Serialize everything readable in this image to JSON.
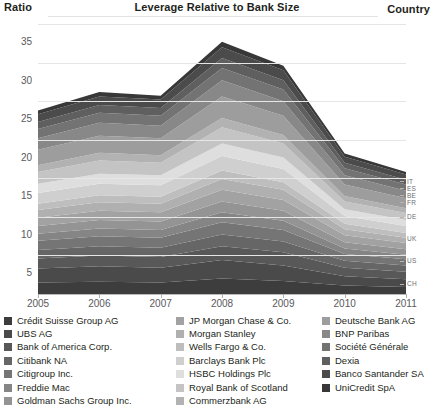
{
  "header": {
    "y_axis_title": "Ratio",
    "title": "Leverage Relative to Bank Size",
    "right_axis_title": "Country"
  },
  "chart_data": {
    "type": "area",
    "title": "Leverage Relative to Bank Size",
    "xlabel": "",
    "ylabel": "Ratio",
    "ylim": [
      0,
      35
    ],
    "yticks": [
      0,
      5,
      10,
      15,
      20,
      25,
      30,
      35
    ],
    "ytick_labels": [
      "",
      "5",
      "10",
      "15",
      "20",
      "25",
      "30",
      "35"
    ],
    "x": [
      2005,
      2006,
      2007,
      2008,
      2009,
      2010,
      2011
    ],
    "xtick_labels": [
      "2005",
      "2006",
      "2007",
      "2008",
      "2009",
      "2010",
      "2011"
    ],
    "grid": true,
    "stacked": true,
    "legend_position": "bottom",
    "country_axis": {
      "label": "Country",
      "ticks": [
        {
          "code": "IT",
          "value": 14.6
        },
        {
          "code": "ES",
          "value": 13.7
        },
        {
          "code": "BE",
          "value": 12.8
        },
        {
          "code": "FR",
          "value": 11.9
        },
        {
          "code": "DE",
          "value": 10.0
        },
        {
          "code": "UK",
          "value": 7.2
        },
        {
          "code": "US",
          "value": 4.3
        },
        {
          "code": "CH",
          "value": 1.3
        }
      ]
    },
    "totals": [
      22.8,
      24.9,
      24.6,
      31.0,
      28.2,
      17.2,
      15.0
    ],
    "series": [
      {
        "name": "Crédit Suisse Group AG",
        "color": "#3d3d3d",
        "values": [
          1.5,
          1.6,
          1.5,
          2.0,
          1.7,
          1.1,
          0.9
        ]
      },
      {
        "name": "UBS AG",
        "color": "#4a4a4a",
        "values": [
          1.8,
          2.0,
          1.9,
          2.4,
          2.0,
          1.2,
          1.0
        ]
      },
      {
        "name": "Bank of America Corp.",
        "color": "#585858",
        "values": [
          1.3,
          1.4,
          1.4,
          1.8,
          1.7,
          1.1,
          1.0
        ]
      },
      {
        "name": "Citibank NA",
        "color": "#666666",
        "values": [
          1.1,
          1.2,
          1.2,
          1.5,
          1.4,
          0.9,
          0.8
        ]
      },
      {
        "name": "Citigroup Inc.",
        "color": "#757575",
        "values": [
          1.2,
          1.3,
          1.3,
          1.6,
          1.5,
          0.9,
          0.8
        ]
      },
      {
        "name": "Freddie Mac",
        "color": "#858585",
        "values": [
          0.9,
          1.0,
          1.0,
          1.3,
          1.2,
          0.7,
          0.6
        ]
      },
      {
        "name": "Goldman Sachs Group Inc.",
        "color": "#949494",
        "values": [
          1.0,
          1.1,
          1.1,
          1.4,
          1.3,
          0.8,
          0.7
        ]
      },
      {
        "name": "JP Morgan Chase & Co.",
        "color": "#a2a2a2",
        "values": [
          1.1,
          1.2,
          1.2,
          1.5,
          1.4,
          0.9,
          0.8
        ]
      },
      {
        "name": "Morgan Stanley",
        "color": "#b0b0b0",
        "values": [
          1.0,
          1.1,
          1.1,
          1.4,
          1.3,
          0.8,
          0.7
        ]
      },
      {
        "name": "Wells Fargo & Co.",
        "color": "#bebebe",
        "values": [
          0.8,
          0.9,
          0.9,
          1.1,
          1.0,
          0.7,
          0.6
        ]
      },
      {
        "name": "Barclays Bank Plc",
        "color": "#cfcfcf",
        "values": [
          1.4,
          1.5,
          1.5,
          1.9,
          1.7,
          1.0,
          0.9
        ]
      },
      {
        "name": "HSBC Holdings Plc",
        "color": "#dedede",
        "values": [
          1.2,
          1.3,
          1.3,
          1.6,
          1.5,
          0.9,
          0.8
        ]
      },
      {
        "name": "Royal Bank of Scotland",
        "color": "#c4c4c4",
        "values": [
          1.5,
          1.7,
          1.6,
          2.1,
          1.8,
          1.0,
          0.9
        ]
      },
      {
        "name": "Commerzbank AG",
        "color": "#b2b2b2",
        "values": [
          0.9,
          1.0,
          1.0,
          1.2,
          1.1,
          0.7,
          0.6
        ]
      },
      {
        "name": "Deutsche Bank AG",
        "color": "#9d9d9d",
        "values": [
          2.0,
          2.2,
          2.2,
          2.8,
          2.5,
          1.5,
          1.3
        ]
      },
      {
        "name": "BNP Paribas",
        "color": "#888888",
        "values": [
          1.5,
          1.7,
          1.6,
          2.1,
          1.9,
          1.2,
          1.0
        ]
      },
      {
        "name": "Société Générale",
        "color": "#737373",
        "values": [
          1.2,
          1.3,
          1.3,
          1.6,
          1.5,
          0.9,
          0.8
        ]
      },
      {
        "name": "Dexia",
        "color": "#5f5f5f",
        "values": [
          0.9,
          1.0,
          1.0,
          1.3,
          1.2,
          0.7,
          0.6
        ]
      },
      {
        "name": "Banco Santander SA",
        "color": "#4b4b4b",
        "values": [
          1.0,
          1.1,
          1.1,
          1.4,
          1.3,
          0.8,
          0.7
        ]
      },
      {
        "name": "UniCredit SpA",
        "color": "#383838",
        "values": [
          0.5,
          0.6,
          0.5,
          0.7,
          0.6,
          0.4,
          0.3
        ]
      }
    ]
  },
  "legend": {
    "columns": [
      {
        "items": [
          0,
          1,
          2,
          3,
          4,
          5,
          6
        ]
      },
      {
        "items": [
          7,
          8,
          9,
          10,
          11,
          12,
          13
        ]
      },
      {
        "items": [
          14,
          15,
          16,
          17,
          18,
          19
        ]
      }
    ]
  }
}
